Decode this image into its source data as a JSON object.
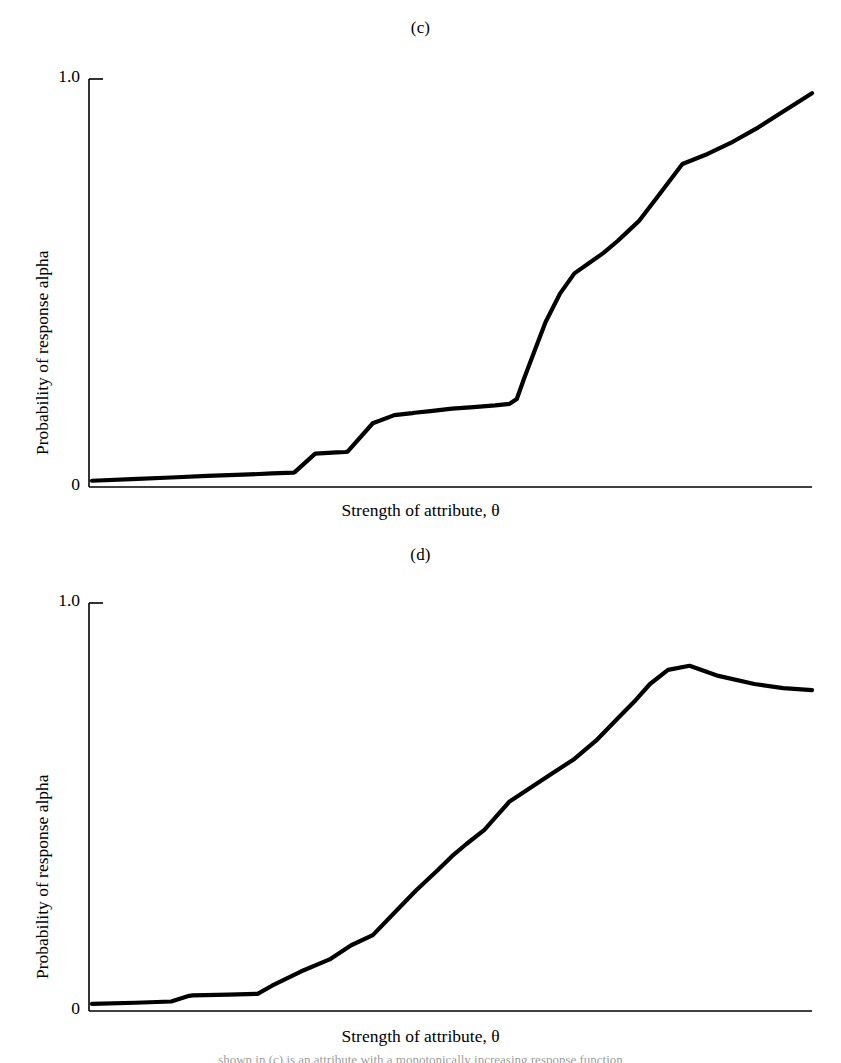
{
  "figure": {
    "background_color": "#ffffff",
    "ink_color": "#000000",
    "bottom_caption": "shown in (c) is an attribute with a monotonically increasing response function"
  },
  "panels": [
    {
      "id": "c",
      "title": "(c)",
      "ylabel": "Probability of response alpha",
      "xlabel": "Strength of attribute, θ",
      "y_tick_top": "1.0",
      "y_tick_bottom": "0"
    },
    {
      "id": "d",
      "title": "(d)",
      "ylabel": "Probability of response alpha",
      "xlabel": "Strength of attribute, θ",
      "y_tick_top": "1.0",
      "y_tick_bottom": "0"
    }
  ],
  "chart_data": [
    {
      "type": "line",
      "title": "(c)",
      "xlabel": "Strength of attribute, θ",
      "ylabel": "Probability of response alpha",
      "ylim": [
        0,
        1.0
      ],
      "xlim": [
        0,
        1.0
      ],
      "yticks": [
        0,
        1.0
      ],
      "ytick_labels": [
        "0",
        "1.0"
      ],
      "xticks": [],
      "grid": false,
      "legend": null,
      "annotations": [],
      "series": [
        {
          "name": "monotonic response function",
          "x": [
            0.0,
            0.055,
            0.11,
            0.16,
            0.21,
            0.25,
            0.28,
            0.282,
            0.31,
            0.34,
            0.352,
            0.355,
            0.39,
            0.42,
            0.445,
            0.448,
            0.47,
            0.5,
            0.53,
            0.56,
            0.58,
            0.59,
            0.6,
            0.615,
            0.63,
            0.65,
            0.67,
            0.69,
            0.71,
            0.73,
            0.745,
            0.76,
            0.79,
            0.82,
            0.855,
            0.89,
            0.925,
            0.96,
            1.0
          ],
          "y": [
            0.008,
            0.012,
            0.016,
            0.02,
            0.023,
            0.026,
            0.028,
            0.03,
            0.075,
            0.078,
            0.079,
            0.08,
            0.15,
            0.17,
            0.175,
            0.176,
            0.18,
            0.186,
            0.19,
            0.194,
            0.198,
            0.21,
            0.26,
            0.33,
            0.4,
            0.47,
            0.52,
            0.545,
            0.57,
            0.6,
            0.625,
            0.65,
            0.72,
            0.79,
            0.815,
            0.845,
            0.88,
            0.92,
            0.965
          ]
        }
      ]
    },
    {
      "type": "line",
      "title": "(d)",
      "xlabel": "Strength of attribute, θ",
      "ylabel": "Probability of response alpha",
      "ylim": [
        0,
        1.0
      ],
      "xlim": [
        0,
        1.0
      ],
      "yticks": [
        0,
        1.0
      ],
      "ytick_labels": [
        "0",
        "1.0"
      ],
      "xticks": [],
      "grid": false,
      "legend": null,
      "annotations": [],
      "series": [
        {
          "name": "nonmonotonic response function",
          "x": [
            0.0,
            0.06,
            0.11,
            0.135,
            0.14,
            0.19,
            0.23,
            0.25,
            0.29,
            0.33,
            0.36,
            0.39,
            0.42,
            0.45,
            0.48,
            0.5,
            0.52,
            0.545,
            0.56,
            0.58,
            0.61,
            0.64,
            0.67,
            0.7,
            0.73,
            0.755,
            0.775,
            0.8,
            0.83,
            0.87,
            0.92,
            0.96,
            1.0
          ],
          "y": [
            0.01,
            0.013,
            0.016,
            0.03,
            0.031,
            0.033,
            0.035,
            0.055,
            0.09,
            0.12,
            0.155,
            0.18,
            0.235,
            0.29,
            0.34,
            0.375,
            0.405,
            0.44,
            0.47,
            0.51,
            0.545,
            0.58,
            0.615,
            0.66,
            0.715,
            0.76,
            0.8,
            0.835,
            0.845,
            0.82,
            0.8,
            0.79,
            0.785
          ]
        }
      ]
    }
  ]
}
